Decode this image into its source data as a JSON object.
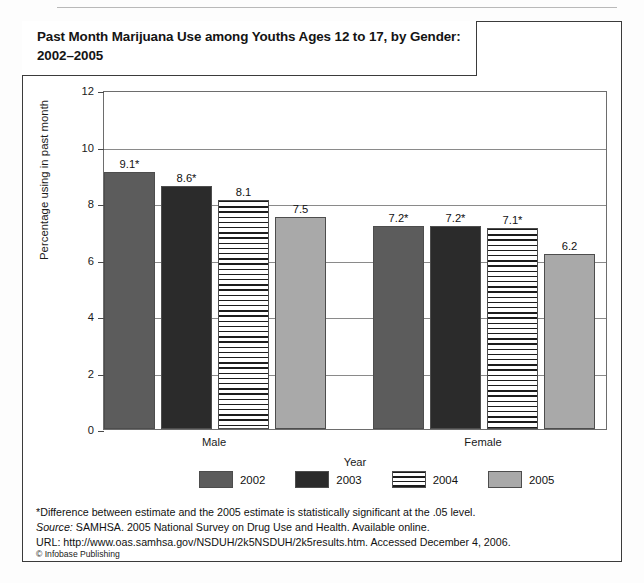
{
  "figure": {
    "title": "Past Month Marijuana Use among Youths Ages 12 to 17, by Gender: 2002–2005",
    "copyright": "© Infobase Publishing",
    "notes": {
      "significance": "*Difference between estimate and the 2005 estimate is statistically significant at the .05 level.",
      "source_prefix": "Source:",
      "source_text": " SAMHSA. 2005 National Survey on Drug Use and Health. Available online.",
      "url_line": "URL: http://www.oas.samhsa.gov/NSDUH/2k5NSDUH/2k5results.htm. Accessed December 4, 2006."
    }
  },
  "chart_data": {
    "type": "bar",
    "title": "Past Month Marijuana Use among Youths Ages 12 to 17, by Gender: 2002–2005",
    "xlabel": "Year",
    "ylabel": "Percentage using in past month",
    "categories": [
      "Male",
      "Female"
    ],
    "ylim": [
      0,
      12
    ],
    "yticks": [
      0,
      2,
      4,
      6,
      8,
      10,
      12
    ],
    "ytick_labels": [
      "0",
      "2",
      "4",
      "6",
      "8",
      "10",
      "12"
    ],
    "grid": true,
    "legend_position": "bottom",
    "series": [
      {
        "name": "2002",
        "color": "#5c5c5c",
        "fill": "solid",
        "values": [
          9.1,
          7.2
        ],
        "labels": [
          "9.1*",
          "7.2*"
        ]
      },
      {
        "name": "2003",
        "color": "#2b2b2b",
        "fill": "solid",
        "values": [
          8.6,
          7.2
        ],
        "labels": [
          "8.6*",
          "7.2*"
        ]
      },
      {
        "name": "2004",
        "color": "#ffffff",
        "fill": "hatch-horizontal",
        "values": [
          8.1,
          7.1
        ],
        "labels": [
          "8.1",
          "7.1*"
        ]
      },
      {
        "name": "2005",
        "color": "#a9a9a9",
        "fill": "solid",
        "values": [
          7.5,
          6.2
        ],
        "labels": [
          "7.5",
          "6.2"
        ]
      }
    ]
  }
}
